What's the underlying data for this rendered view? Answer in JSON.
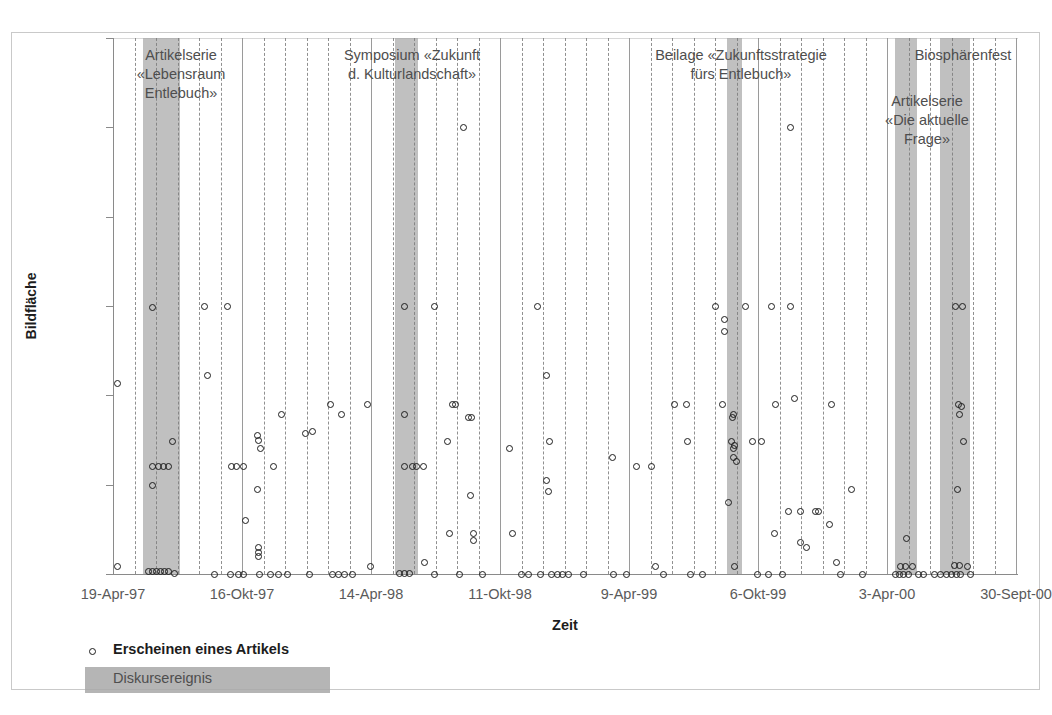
{
  "chart_data": {
    "type": "scatter",
    "title": "",
    "xlabel": "Zeit",
    "ylabel": "Bildfläche",
    "ylim": [
      0,
      600
    ],
    "yticks": [
      0,
      100,
      200,
      300,
      400,
      500,
      600
    ],
    "ytick_labels": [
      "0",
      "100",
      "200",
      "300",
      "400",
      "500",
      "600"
    ],
    "xtick_labels": [
      "19-Apr-97",
      "16-Okt-97",
      "14-Apr-98",
      "11-Okt-98",
      "9-Apr-99",
      "6-Okt-99",
      "3-Apr-00",
      "30-Sept-00"
    ],
    "xtick_positions_px": [
      113,
      242,
      371,
      500,
      629,
      758,
      887,
      1016
    ],
    "grid": "vertical-dashed",
    "legend_position": "below-axis-left",
    "series": [
      {
        "name": "Erscheinen eines Artikels",
        "marker": "open-circle",
        "points": [
          {
            "x": 117,
            "y": 213
          },
          {
            "x": 117,
            "y": 8
          },
          {
            "x": 152,
            "y": 298
          },
          {
            "x": 152,
            "y": 120
          },
          {
            "x": 152,
            "y": 99
          },
          {
            "x": 148,
            "y": 3
          },
          {
            "x": 152,
            "y": 3
          },
          {
            "x": 156,
            "y": 3
          },
          {
            "x": 160,
            "y": 3
          },
          {
            "x": 164,
            "y": 3
          },
          {
            "x": 168,
            "y": 3
          },
          {
            "x": 158,
            "y": 120
          },
          {
            "x": 163,
            "y": 120
          },
          {
            "x": 168,
            "y": 120
          },
          {
            "x": 172,
            "y": 148
          },
          {
            "x": 174,
            "y": 1
          },
          {
            "x": 204,
            "y": 299
          },
          {
            "x": 207,
            "y": 222
          },
          {
            "x": 214,
            "y": 0
          },
          {
            "x": 227,
            "y": 299
          },
          {
            "x": 231,
            "y": 120
          },
          {
            "x": 236,
            "y": 120
          },
          {
            "x": 230,
            "y": 0
          },
          {
            "x": 238,
            "y": 0
          },
          {
            "x": 243,
            "y": 120
          },
          {
            "x": 245,
            "y": 60
          },
          {
            "x": 243,
            "y": 0
          },
          {
            "x": 257,
            "y": 155
          },
          {
            "x": 258,
            "y": 150
          },
          {
            "x": 260,
            "y": 141
          },
          {
            "x": 257,
            "y": 95
          },
          {
            "x": 258,
            "y": 30
          },
          {
            "x": 258,
            "y": 24
          },
          {
            "x": 258,
            "y": 20
          },
          {
            "x": 259,
            "y": 0
          },
          {
            "x": 273,
            "y": 120
          },
          {
            "x": 270,
            "y": 0
          },
          {
            "x": 278,
            "y": 0
          },
          {
            "x": 281,
            "y": 178
          },
          {
            "x": 287,
            "y": 0
          },
          {
            "x": 305,
            "y": 157
          },
          {
            "x": 312,
            "y": 160
          },
          {
            "x": 309,
            "y": 0
          },
          {
            "x": 330,
            "y": 190
          },
          {
            "x": 332,
            "y": 0
          },
          {
            "x": 338,
            "y": 0
          },
          {
            "x": 344,
            "y": 0
          },
          {
            "x": 341,
            "y": 178
          },
          {
            "x": 352,
            "y": 0
          },
          {
            "x": 367,
            "y": 190
          },
          {
            "x": 370,
            "y": 8
          },
          {
            "x": 404,
            "y": 299
          },
          {
            "x": 404,
            "y": 178
          },
          {
            "x": 404,
            "y": 120
          },
          {
            "x": 399,
            "y": 1
          },
          {
            "x": 404,
            "y": 1
          },
          {
            "x": 409,
            "y": 1
          },
          {
            "x": 412,
            "y": 120
          },
          {
            "x": 416,
            "y": 120
          },
          {
            "x": 423,
            "y": 120
          },
          {
            "x": 424,
            "y": 13
          },
          {
            "x": 434,
            "y": 299
          },
          {
            "x": 434,
            "y": 0
          },
          {
            "x": 447,
            "y": 148
          },
          {
            "x": 449,
            "y": 45
          },
          {
            "x": 452,
            "y": 190
          },
          {
            "x": 455,
            "y": 190
          },
          {
            "x": 459,
            "y": 0
          },
          {
            "x": 463,
            "y": 500
          },
          {
            "x": 468,
            "y": 175
          },
          {
            "x": 471,
            "y": 175
          },
          {
            "x": 470,
            "y": 88
          },
          {
            "x": 473,
            "y": 45
          },
          {
            "x": 473,
            "y": 37
          },
          {
            "x": 482,
            "y": 0
          },
          {
            "x": 509,
            "y": 140
          },
          {
            "x": 512,
            "y": 45
          },
          {
            "x": 521,
            "y": 0
          },
          {
            "x": 528,
            "y": 0
          },
          {
            "x": 537,
            "y": 299
          },
          {
            "x": 540,
            "y": 0
          },
          {
            "x": 546,
            "y": 222
          },
          {
            "x": 549,
            "y": 148
          },
          {
            "x": 546,
            "y": 105
          },
          {
            "x": 548,
            "y": 92
          },
          {
            "x": 551,
            "y": 0
          },
          {
            "x": 557,
            "y": 0
          },
          {
            "x": 562,
            "y": 0
          },
          {
            "x": 568,
            "y": 0
          },
          {
            "x": 583,
            "y": 0
          },
          {
            "x": 612,
            "y": 130
          },
          {
            "x": 613,
            "y": 0
          },
          {
            "x": 626,
            "y": 0
          },
          {
            "x": 636,
            "y": 120
          },
          {
            "x": 651,
            "y": 120
          },
          {
            "x": 655,
            "y": 8
          },
          {
            "x": 663,
            "y": 0
          },
          {
            "x": 674,
            "y": 190
          },
          {
            "x": 686,
            "y": 190
          },
          {
            "x": 687,
            "y": 148
          },
          {
            "x": 690,
            "y": 0
          },
          {
            "x": 702,
            "y": 0
          },
          {
            "x": 715,
            "y": 299
          },
          {
            "x": 724,
            "y": 285
          },
          {
            "x": 724,
            "y": 272
          },
          {
            "x": 722,
            "y": 190
          },
          {
            "x": 732,
            "y": 175
          },
          {
            "x": 733,
            "y": 178
          },
          {
            "x": 731,
            "y": 148
          },
          {
            "x": 734,
            "y": 144
          },
          {
            "x": 733,
            "y": 140
          },
          {
            "x": 733,
            "y": 130
          },
          {
            "x": 736,
            "y": 126
          },
          {
            "x": 728,
            "y": 80
          },
          {
            "x": 734,
            "y": 8
          },
          {
            "x": 745,
            "y": 299
          },
          {
            "x": 752,
            "y": 148
          },
          {
            "x": 761,
            "y": 148
          },
          {
            "x": 757,
            "y": 0
          },
          {
            "x": 768,
            "y": 0
          },
          {
            "x": 771,
            "y": 299
          },
          {
            "x": 775,
            "y": 190
          },
          {
            "x": 774,
            "y": 45
          },
          {
            "x": 782,
            "y": 0
          },
          {
            "x": 790,
            "y": 299
          },
          {
            "x": 790,
            "y": 500
          },
          {
            "x": 794,
            "y": 197
          },
          {
            "x": 788,
            "y": 70
          },
          {
            "x": 800,
            "y": 35
          },
          {
            "x": 806,
            "y": 30
          },
          {
            "x": 800,
            "y": 70
          },
          {
            "x": 815,
            "y": 70
          },
          {
            "x": 818,
            "y": 70
          },
          {
            "x": 831,
            "y": 190
          },
          {
            "x": 829,
            "y": 55
          },
          {
            "x": 836,
            "y": 13
          },
          {
            "x": 840,
            "y": 0
          },
          {
            "x": 851,
            "y": 95
          },
          {
            "x": 862,
            "y": 0
          },
          {
            "x": 895,
            "y": 0
          },
          {
            "x": 899,
            "y": 0
          },
          {
            "x": 903,
            "y": 0
          },
          {
            "x": 908,
            "y": 0
          },
          {
            "x": 900,
            "y": 8
          },
          {
            "x": 905,
            "y": 8
          },
          {
            "x": 912,
            "y": 8
          },
          {
            "x": 906,
            "y": 40
          },
          {
            "x": 918,
            "y": 0
          },
          {
            "x": 923,
            "y": 0
          },
          {
            "x": 934,
            "y": 0
          },
          {
            "x": 940,
            "y": 0
          },
          {
            "x": 946,
            "y": 0
          },
          {
            "x": 951,
            "y": 0
          },
          {
            "x": 956,
            "y": 0
          },
          {
            "x": 960,
            "y": 0
          },
          {
            "x": 955,
            "y": 299
          },
          {
            "x": 962,
            "y": 299
          },
          {
            "x": 958,
            "y": 190
          },
          {
            "x": 961,
            "y": 187
          },
          {
            "x": 959,
            "y": 178
          },
          {
            "x": 963,
            "y": 148
          },
          {
            "x": 957,
            "y": 95
          },
          {
            "x": 954,
            "y": 10
          },
          {
            "x": 959,
            "y": 10
          },
          {
            "x": 967,
            "y": 8
          },
          {
            "x": 970,
            "y": 0
          }
        ]
      }
    ],
    "bands": [
      {
        "label": "Artikelserie\n«Lebensraum\nEntlebuch»",
        "x_start_px": 143,
        "x_end_px": 180,
        "label_x_px": 181,
        "label_y_px": 46
      },
      {
        "label": "Symposium «Zukunft\nd. Kulturlandschaft»",
        "x_start_px": 395,
        "x_end_px": 418,
        "label_x_px": 412,
        "label_y_px": 46
      },
      {
        "label": "Beilage «Zukunftsstrategie\nfürs Entlebuch»",
        "x_start_px": 727,
        "x_end_px": 742,
        "label_x_px": 741,
        "label_y_px": 46
      },
      {
        "label": "Artikelserie\n«Die aktuelle Frage»",
        "x_start_px": 895,
        "x_end_px": 917,
        "label_x_px": 927,
        "label_y_px": 92
      },
      {
        "label": "Biosphärenfest",
        "x_start_px": 940,
        "x_end_px": 970,
        "label_x_px": 963,
        "label_y_px": 46
      }
    ],
    "band_color": "#a8a8a8",
    "marker_color": "#1d1d1d"
  },
  "axis": {
    "y_title": "Bildfläche",
    "x_title": "Zeit"
  },
  "legend": {
    "marker_label": "Erscheinen eines Artikels",
    "band_label": "Diskursereignis"
  }
}
